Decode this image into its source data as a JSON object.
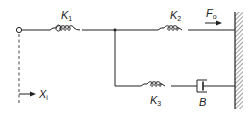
{
  "diagram": {
    "labels": {
      "k1": {
        "main": "K",
        "sub": "1"
      },
      "k2": {
        "main": "K",
        "sub": "2"
      },
      "k3": {
        "main": "K",
        "sub": "3"
      },
      "b": {
        "main": "B"
      },
      "f0": {
        "main": "F",
        "sub": "o"
      },
      "xi": {
        "main": "X",
        "sub": "i"
      }
    },
    "components": [
      {
        "id": "K1",
        "type": "spring"
      },
      {
        "id": "K2",
        "type": "spring"
      },
      {
        "id": "K3",
        "type": "spring"
      },
      {
        "id": "B",
        "type": "damper"
      },
      {
        "id": "wall",
        "type": "fixed-ground"
      },
      {
        "id": "input-node",
        "type": "terminal"
      }
    ],
    "colors": {
      "line": "#222222",
      "background": "#ffffff"
    }
  }
}
